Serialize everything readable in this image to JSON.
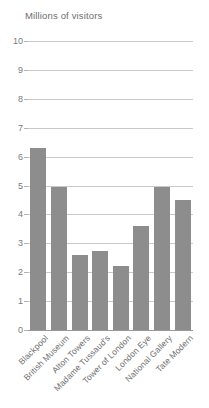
{
  "chart_data": {
    "type": "bar",
    "title": "Millions of visitors",
    "xlabel": "",
    "ylabel": "Millions of visitors",
    "ylim": [
      0,
      10
    ],
    "yticks": [
      0,
      1,
      2,
      3,
      4,
      5,
      6,
      7,
      8,
      9,
      10
    ],
    "ytick_labels": [
      "0",
      "1",
      "2",
      "3",
      "4",
      "5",
      "6",
      "7",
      "8",
      "9",
      "10"
    ],
    "grid": true,
    "legend": "none",
    "bar_color": "#8d8d8d",
    "gridline_color": "#c9c9c9",
    "categories": [
      "Blackpool",
      "British Museum",
      "Alton Towers",
      "Madame Tussaud's",
      "Tower of London",
      "London Eye",
      "National Gallery",
      "Tate Modern"
    ],
    "values": [
      6.3,
      4.95,
      2.6,
      2.75,
      2.2,
      3.6,
      4.95,
      4.5
    ]
  }
}
